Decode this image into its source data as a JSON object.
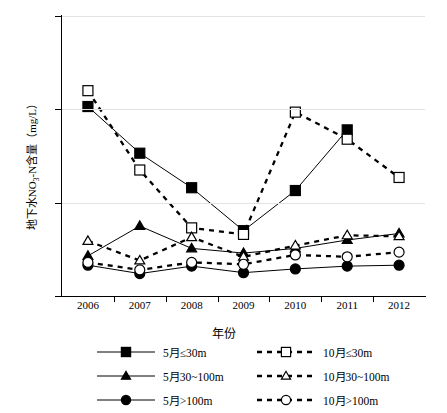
{
  "chart_data": {
    "type": "line",
    "title": "",
    "xlabel": "年份",
    "ylabel": "地下水NO3-N含量（mg/L）",
    "ylabel_parts": {
      "pre": "地下水NO",
      "sub": "3",
      "post": "-N含量（mg/L）"
    },
    "categories": [
      "2006",
      "2007",
      "2008",
      "2009",
      "2010",
      "2011",
      "2012"
    ],
    "ylim": [
      0,
      30
    ],
    "yticks": [
      0,
      10,
      20,
      30
    ],
    "grid": "horizontal-light",
    "legend_position": "bottom",
    "series": [
      {
        "name": "5月≤30m",
        "marker": "filled-square",
        "line": "solid",
        "values": [
          20.3,
          15.3,
          11.6,
          7.0,
          11.3,
          17.8,
          null
        ]
      },
      {
        "name": "10月≤30m",
        "marker": "open-square",
        "line": "dashed",
        "values": [
          22.0,
          13.5,
          7.3,
          6.6,
          19.7,
          16.8,
          12.7
        ]
      },
      {
        "name": "5月30~100m",
        "marker": "filled-triangle",
        "line": "solid",
        "values": [
          4.3,
          7.5,
          5.1,
          4.6,
          5.1,
          6.0,
          6.7
        ]
      },
      {
        "name": "10月30~100m",
        "marker": "open-triangle",
        "line": "dashed",
        "values": [
          5.9,
          3.8,
          6.3,
          4.2,
          5.4,
          6.5,
          6.4
        ]
      },
      {
        "name": "5月>100m",
        "marker": "filled-circle",
        "line": "solid",
        "values": [
          3.3,
          2.4,
          3.2,
          2.5,
          2.9,
          3.2,
          3.3
        ]
      },
      {
        "name": "10月>100m",
        "marker": "open-circle",
        "line": "dashed",
        "values": [
          3.6,
          2.8,
          3.6,
          3.4,
          4.4,
          4.2,
          4.7
        ]
      }
    ]
  },
  "axes": {
    "y_tick_labels": [
      "0",
      "10",
      "20",
      "30"
    ],
    "x_tick_labels": [
      "2006",
      "2007",
      "2008",
      "2009",
      "2010",
      "2011",
      "2012"
    ],
    "x_axis_title": "年份"
  },
  "legend": {
    "items": [
      {
        "label": "5月≤30m",
        "marker": "filled-square",
        "line": "solid",
        "col": 0,
        "row": 0
      },
      {
        "label": "10月≤30m",
        "marker": "open-square",
        "line": "dashed",
        "col": 1,
        "row": 0
      },
      {
        "label": "5月30~100m",
        "marker": "filled-triangle",
        "line": "solid",
        "col": 0,
        "row": 1
      },
      {
        "label": "10月30~100m",
        "marker": "open-triangle",
        "line": "dashed",
        "col": 1,
        "row": 1
      },
      {
        "label": "5月>100m",
        "marker": "filled-circle",
        "line": "solid",
        "col": 0,
        "row": 2
      },
      {
        "label": "10月>100m",
        "marker": "open-circle",
        "line": "dashed",
        "col": 1,
        "row": 2
      }
    ]
  },
  "colors": {
    "ink": "#000000",
    "grid": "#e2e2e2",
    "background": "#ffffff"
  }
}
